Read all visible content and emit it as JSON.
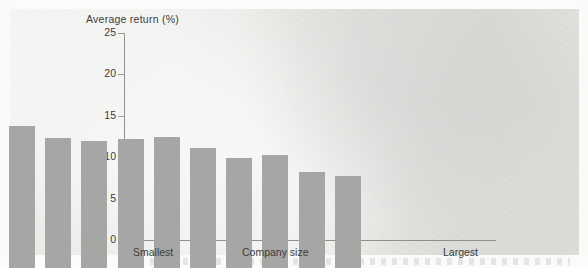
{
  "figure": {
    "background_color": "#e9e9e6",
    "bar_color": "#a6a6a4",
    "axis_color": "#8f8f8d",
    "text_color": "#3c3c3c"
  },
  "chart_data": {
    "type": "bar",
    "title": "",
    "ylabel": "Average return (%)",
    "xlabel": "Company size",
    "xlim_labels": [
      "Smallest",
      "Largest"
    ],
    "ylim": [
      0,
      25
    ],
    "yticks": [
      0,
      5,
      10,
      15,
      20,
      25
    ],
    "ytick_labels": [
      "0",
      "5",
      "10",
      "15",
      "20",
      "25"
    ],
    "grid": false,
    "legend": null,
    "categories": [
      "1",
      "2",
      "3",
      "4",
      "5",
      "6",
      "7",
      "8",
      "9",
      "10"
    ],
    "values": [
      17.1,
      15.7,
      15.3,
      15.6,
      15.8,
      14.5,
      13.3,
      13.6,
      11.6,
      11.1
    ]
  }
}
